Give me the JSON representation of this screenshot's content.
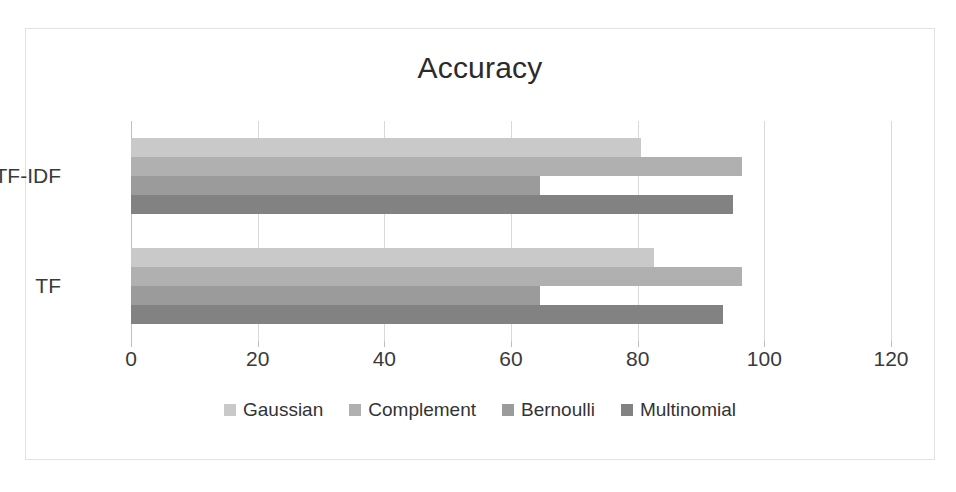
{
  "chart_data": {
    "type": "bar",
    "orientation": "horizontal",
    "title": "Accuracy",
    "xlabel": "",
    "ylabel": "",
    "categories": [
      "TF",
      "TF-IDF"
    ],
    "series": [
      {
        "name": "Gaussian",
        "values": [
          82.5,
          80.5
        ],
        "color": "#c9c9c9"
      },
      {
        "name": "Complement",
        "values": [
          96.5,
          96.5
        ],
        "color": "#b0b0b0"
      },
      {
        "name": "Bernoulli",
        "values": [
          64.5,
          64.5
        ],
        "color": "#9b9b9b"
      },
      {
        "name": "Multinomial",
        "values": [
          93.5,
          95.0
        ],
        "color": "#828282"
      }
    ],
    "xlim": [
      0,
      120
    ],
    "xticks": [
      0,
      20,
      40,
      60,
      80,
      100,
      120
    ],
    "xtick_labels": [
      "0",
      "20",
      "40",
      "60",
      "80",
      "100",
      "120"
    ],
    "grid": true,
    "grid_axis": "x",
    "legend_position": "bottom",
    "background_color": "#ffffff",
    "border_color": "#e2e2e2"
  },
  "legend": {
    "items": [
      {
        "label": "Gaussian"
      },
      {
        "label": "Complement"
      },
      {
        "label": "Bernoulli"
      },
      {
        "label": "Multinomial"
      }
    ]
  },
  "axis": {
    "y_categories": [
      {
        "label": "TF-IDF"
      },
      {
        "label": "TF"
      }
    ]
  }
}
